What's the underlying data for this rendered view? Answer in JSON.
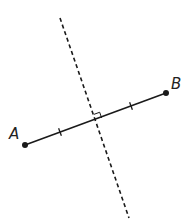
{
  "diagram": {
    "type": "perpendicular-bisector",
    "colors": {
      "line": "#1a1a1a",
      "background": "#ffffff"
    },
    "points": [
      {
        "id": "A",
        "label": "A",
        "x": 25,
        "y": 145,
        "label_x": 9,
        "label_y": 139
      },
      {
        "id": "B",
        "label": "B",
        "x": 166,
        "y": 93,
        "label_x": 171,
        "label_y": 89
      }
    ],
    "segment": {
      "from": "A",
      "to": "B",
      "style": "solid"
    },
    "bisector": {
      "x1": 60,
      "y1": 18,
      "x2": 129,
      "y2": 218,
      "style": "dashed"
    },
    "intersection": {
      "x": 96,
      "y": 120
    },
    "tick_marks": [
      {
        "x": 60,
        "y": 132
      },
      {
        "x": 131,
        "y": 106
      }
    ],
    "right_angle_marker": true
  }
}
